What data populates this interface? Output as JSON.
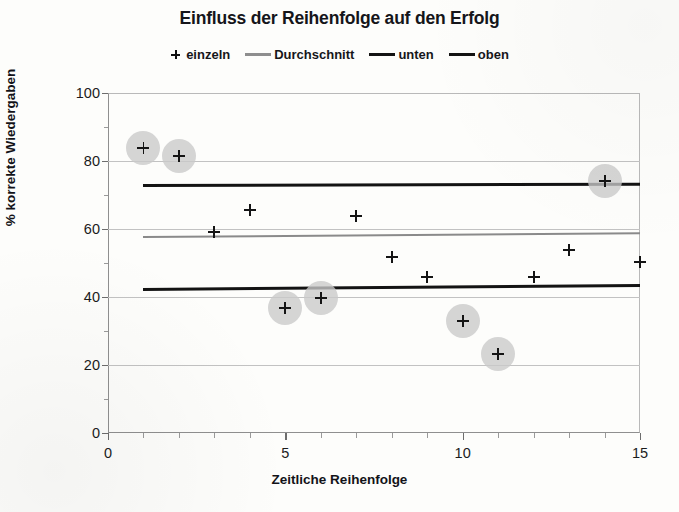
{
  "chart_data": {
    "type": "scatter",
    "title": "Einfluss der Reihenfolge auf den Erfolg",
    "xlabel": "Zeitliche Reihenfolge",
    "ylabel": "% korrekte Wiedergaben",
    "xlim": [
      0,
      15
    ],
    "ylim": [
      0,
      100
    ],
    "xticks": [
      0,
      5,
      10,
      15
    ],
    "yticks": [
      0,
      20,
      40,
      60,
      80,
      100
    ],
    "xminor_step": 1,
    "yminor_step": 10,
    "grid": "horizontal-major",
    "legend_position": "top-center",
    "legend": [
      {
        "label": "einzeln",
        "marker": "plus",
        "color": "#141414"
      },
      {
        "label": "Durchschnitt",
        "marker": "line",
        "color": "#8e8e8e"
      },
      {
        "label": "unten",
        "marker": "line",
        "color": "#131313"
      },
      {
        "label": "oben",
        "marker": "line",
        "color": "#131313"
      }
    ],
    "series": [
      {
        "name": "einzeln",
        "type": "scatter",
        "marker": "plus",
        "x": [
          1,
          2,
          3,
          4,
          5,
          6,
          7,
          8,
          9,
          10,
          11,
          12,
          13,
          14,
          15
        ],
        "y": [
          83.8,
          81.5,
          59.2,
          65.6,
          36.8,
          39.6,
          63.8,
          51.7,
          45.8,
          33.0,
          23.2,
          45.9,
          53.8,
          74.0,
          50.3
        ],
        "highlighted_points": [
          1,
          2,
          5,
          6,
          10,
          11,
          14
        ]
      },
      {
        "name": "oben",
        "type": "line",
        "color": "#131313",
        "width": 3.6,
        "x": [
          1,
          15
        ],
        "y": [
          73.2,
          73.6
        ]
      },
      {
        "name": "Durchschnitt",
        "type": "line",
        "color": "#8a8a8a",
        "width": 2.4,
        "x": [
          1,
          15
        ],
        "y": [
          57.9,
          59.0
        ]
      },
      {
        "name": "unten",
        "type": "line",
        "color": "#131313",
        "width": 3.6,
        "x": [
          1,
          15
        ],
        "y": [
          42.6,
          43.8
        ]
      }
    ]
  }
}
